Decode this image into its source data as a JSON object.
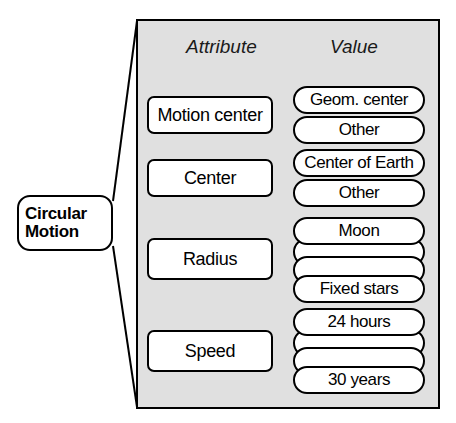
{
  "diagram": {
    "title_node": {
      "label": "Circular\nMotion",
      "shape": "rounded-rectangle"
    },
    "panel": {
      "background_color": "#e0e0e0",
      "border_color": "#000000"
    },
    "columns": {
      "attribute_header": "Attribute",
      "value_header": "Value"
    },
    "rows": [
      {
        "attribute": "Motion center",
        "values": [
          "Geom. center",
          "Other"
        ]
      },
      {
        "attribute": "Center",
        "values": [
          "Center of Earth",
          "Other"
        ]
      },
      {
        "attribute": "Radius",
        "values": [
          "Moon",
          "",
          "",
          "Fixed stars"
        ]
      },
      {
        "attribute": "Speed",
        "values": [
          "24 hours",
          "",
          "",
          "30 years"
        ]
      }
    ]
  }
}
